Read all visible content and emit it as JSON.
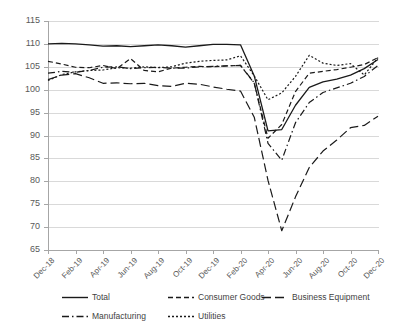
{
  "chart_data": {
    "type": "line",
    "title": "",
    "subtitle": "",
    "xlabel": "",
    "ylabel": "",
    "ylim": [
      65,
      115
    ],
    "ytick_step": 5,
    "yticks": [
      "115",
      "110",
      "105",
      "100",
      "95",
      "90",
      "85",
      "80",
      "75",
      "70",
      "65"
    ],
    "grid": true,
    "legend_position": "bottom",
    "x": [
      "Dec-18",
      "Jan-19",
      "Feb-19",
      "Mar-19",
      "Apr-19",
      "May-19",
      "Jun-19",
      "Jul-19",
      "Aug-19",
      "Sep-19",
      "Oct-19",
      "Nov-19",
      "Dec-19",
      "Jan-20",
      "Feb-20",
      "Mar-20",
      "Apr-20",
      "May-20",
      "Jun-20",
      "Jul-20",
      "Aug-20",
      "Sep-20",
      "Oct-20",
      "Nov-20",
      "Dec-20"
    ],
    "xticks": [
      "Dec-18",
      "Feb-19",
      "Apr-19",
      "Jun-19",
      "Aug-19",
      "Oct-19",
      "Dec-19",
      "Feb-20",
      "Apr-20",
      "Jun-20",
      "Aug-20",
      "Oct-20",
      "Dec-20"
    ],
    "series": [
      {
        "name": "Total",
        "style": "solid",
        "values": [
          110.0,
          110.1,
          110.0,
          109.8,
          109.5,
          109.6,
          109.4,
          109.6,
          109.8,
          109.6,
          109.3,
          109.6,
          109.9,
          109.9,
          109.8,
          103.0,
          91.0,
          91.3,
          96.6,
          100.5,
          101.7,
          102.3,
          103.2,
          104.6,
          106.6
        ]
      },
      {
        "name": "Consumer Goods",
        "style": "dashed",
        "values": [
          106.2,
          105.6,
          104.9,
          104.8,
          105.3,
          104.6,
          106.8,
          104.2,
          103.9,
          104.7,
          104.9,
          105.1,
          105.0,
          105.2,
          105.3,
          101.4,
          89.4,
          92.4,
          99.6,
          103.6,
          104.0,
          104.4,
          104.9,
          105.5,
          107.0
        ]
      },
      {
        "name": "Business Equipment",
        "style": "longdash",
        "values": [
          102.2,
          103.2,
          103.5,
          102.6,
          101.4,
          101.5,
          101.3,
          101.4,
          100.9,
          100.7,
          101.4,
          101.2,
          100.6,
          100.1,
          99.7,
          94.0,
          80.2,
          69.2,
          76.6,
          83.0,
          86.6,
          89.0,
          91.7,
          92.2,
          94.2
        ]
      },
      {
        "name": "Manufacturing",
        "style": "dashdot",
        "values": [
          103.6,
          104.0,
          103.8,
          104.2,
          104.9,
          105.0,
          104.6,
          104.8,
          104.9,
          104.7,
          104.7,
          105.0,
          105.1,
          105.2,
          105.3,
          101.5,
          88.3,
          84.6,
          92.8,
          97.2,
          99.4,
          100.4,
          101.4,
          102.9,
          105.3
        ]
      },
      {
        "name": "Utilities",
        "style": "dotted",
        "values": [
          102.0,
          103.3,
          103.9,
          104.2,
          104.3,
          104.8,
          104.7,
          105.0,
          104.8,
          105.0,
          105.8,
          106.2,
          106.4,
          106.5,
          107.4,
          103.0,
          97.8,
          99.3,
          102.9,
          107.5,
          105.8,
          105.3,
          105.7,
          103.2,
          107.0
        ]
      }
    ]
  },
  "legend": {
    "items": [
      {
        "label": "Total",
        "style": "solid"
      },
      {
        "label": "Consumer Goods",
        "style": "dashed"
      },
      {
        "label": "Business Equipment",
        "style": "longdash"
      },
      {
        "label": "Manufacturing",
        "style": "dashdot"
      },
      {
        "label": "Utilities",
        "style": "dotted"
      }
    ]
  },
  "colors": {
    "line": "#1a1a1a",
    "grid": "#d9d9d9",
    "axis": "#a6a6a6",
    "text": "#595959",
    "background": "#ffffff"
  }
}
